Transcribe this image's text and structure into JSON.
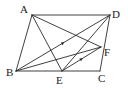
{
  "diagram": {
    "type": "geometry-figure",
    "shape": "parallelogram ABCD",
    "colors": {
      "stroke": "#2a2a2a",
      "label": "#222222",
      "background": "#ffffff"
    },
    "points": {
      "A": {
        "label": "A",
        "x": 32,
        "y": 15
      },
      "D": {
        "label": "D",
        "x": 110,
        "y": 15
      },
      "B": {
        "label": "B",
        "x": 16,
        "y": 71
      },
      "C": {
        "label": "C",
        "x": 100,
        "y": 71
      },
      "E": {
        "label": "E",
        "x": 62,
        "y": 71
      },
      "F": {
        "label": "F",
        "x": 101,
        "y": 47
      }
    },
    "segments": [
      {
        "name": "AD",
        "from": "A",
        "to": "D"
      },
      {
        "name": "AB",
        "from": "A",
        "to": "B"
      },
      {
        "name": "BC",
        "from": "B",
        "to": "C"
      },
      {
        "name": "CD",
        "from": "C",
        "to": "D"
      },
      {
        "name": "BD",
        "from": "B",
        "to": "D",
        "arrow": true
      },
      {
        "name": "AE",
        "from": "A",
        "to": "E"
      },
      {
        "name": "AF",
        "from": "A",
        "to": "F"
      },
      {
        "name": "BF",
        "from": "B",
        "to": "F"
      },
      {
        "name": "DE",
        "from": "D",
        "to": "E"
      },
      {
        "name": "EF",
        "from": "E",
        "to": "F",
        "arrow": true
      }
    ],
    "annotations": [
      "BD ∥ EF (parallel arrow marks)"
    ]
  }
}
